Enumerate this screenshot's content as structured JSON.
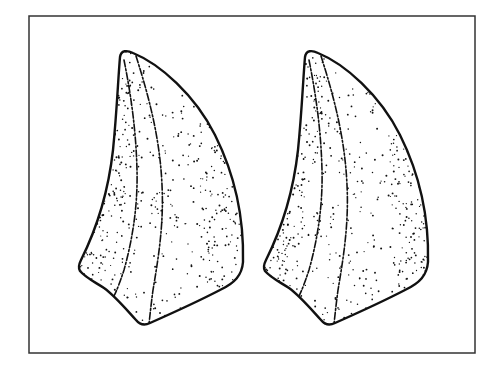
{
  "figure": {
    "frame": {
      "x": 29,
      "y": 16,
      "width": 446,
      "height": 337,
      "color": "#333333"
    },
    "ink_color": "#111111",
    "background": "#ffffff",
    "specimens": [
      {
        "id": "left",
        "offset_x": 0,
        "offset_y": 0
      },
      {
        "id": "right",
        "offset_x": 185,
        "offset_y": 0
      }
    ]
  }
}
